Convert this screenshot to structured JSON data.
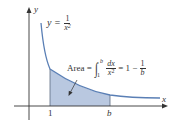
{
  "diagram": {
    "type": "area-under-curve",
    "function": "y = 1/x^2",
    "axes": {
      "x_label": "x",
      "y_label": "y",
      "x_ticks": [
        "1",
        "b"
      ]
    },
    "curve_label": {
      "lhs": "y =",
      "numerator": "1",
      "denominator": "x",
      "exponent": "2"
    },
    "area_label": {
      "prefix": "Area =",
      "integral_upper": "b",
      "integral_lower": "1",
      "integrand_num": "dx",
      "integrand_den": "x",
      "integrand_exp": "2",
      "equals": "= 1 −",
      "result_num": "1",
      "result_den": "b"
    },
    "colors": {
      "curve": "#5a7fb5",
      "fill": "#b9c8e0",
      "axis": "#333333",
      "text": "#333333"
    }
  }
}
